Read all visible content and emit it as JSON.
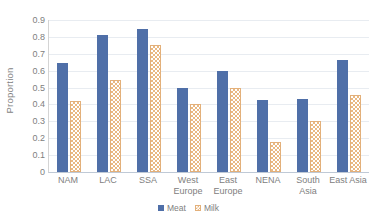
{
  "chart_data": {
    "type": "bar",
    "title": "",
    "xlabel": "",
    "ylabel": "Proportion",
    "ylim": [
      0,
      0.9
    ],
    "grid": true,
    "legend_position": "bottom",
    "categories": [
      "NAM",
      "LAC",
      "SSA",
      "West Europe",
      "East Europe",
      "NENA",
      "South Asia",
      "East Asia"
    ],
    "ytick_labels": [
      "0.9",
      "0.8",
      "0.7",
      "0.6",
      "0.5",
      "0.4",
      "0.3",
      "0.2",
      "0.1",
      "0"
    ],
    "ytick_values": [
      0.9,
      0.8,
      0.7,
      0.6,
      0.5,
      0.4,
      0.3,
      0.2,
      0.1,
      0
    ],
    "series": [
      {
        "name": "Meat",
        "color": "#4f6fa8",
        "values": [
          0.645,
          0.81,
          0.845,
          0.5,
          0.6,
          0.425,
          0.435,
          0.665
        ]
      },
      {
        "name": "Milk",
        "color": "#e9b882",
        "values": [
          0.42,
          0.545,
          0.75,
          0.4,
          0.5,
          0.18,
          0.3,
          0.455
        ]
      }
    ]
  },
  "legend": {
    "items": [
      {
        "label": "Meat",
        "swatch": "meat-swatch-icon"
      },
      {
        "label": "Milk",
        "swatch": "milk-swatch-icon"
      }
    ]
  }
}
